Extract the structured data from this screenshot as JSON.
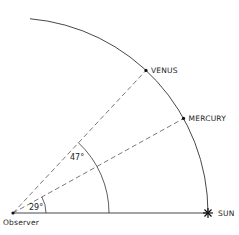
{
  "diagram": {
    "title": "",
    "observer": {
      "label": "Observer"
    },
    "sun": {
      "label": "SUN"
    },
    "planets": [
      {
        "name": "VENUS",
        "elongation_deg": 47
      },
      {
        "name": "MERCURY",
        "elongation_deg": 29
      }
    ],
    "angles": [
      {
        "label": "47°",
        "value_deg": 47
      },
      {
        "label": "29°",
        "value_deg": 29
      }
    ],
    "colors": {
      "line": "#333333",
      "dash": "#555555",
      "text": "#222222"
    }
  }
}
